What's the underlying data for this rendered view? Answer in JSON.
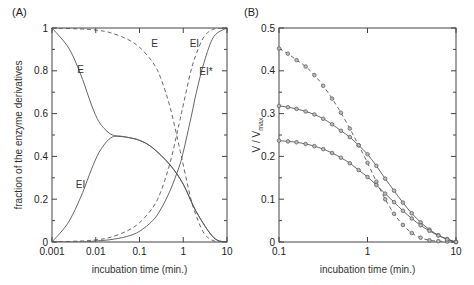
{
  "chart_data": [
    {
      "panel": "(A)",
      "type": "line",
      "xscale": "log",
      "xlabel": "incubation time (min.)",
      "ylabel": "fraction of the enzyme derivatives",
      "xlim": [
        0.001,
        10
      ],
      "ylim": [
        0,
        1
      ],
      "xticks": [
        "0.001",
        "0.01",
        "0.1",
        "1",
        "10"
      ],
      "yticks": [
        "0",
        "0.2",
        "0.4",
        "0.6",
        "0.8",
        "1"
      ],
      "grid": false,
      "series": [
        {
          "name": "E",
          "style": "solid",
          "x": [
            0.001,
            0.002,
            0.003,
            0.005,
            0.008,
            0.012,
            0.02,
            0.03,
            0.05,
            0.1,
            0.2,
            0.5,
            1,
            2,
            5,
            10
          ],
          "y": [
            1.0,
            0.93,
            0.87,
            0.76,
            0.64,
            0.56,
            0.51,
            0.495,
            0.49,
            0.475,
            0.44,
            0.36,
            0.27,
            0.14,
            0.02,
            0.0
          ]
        },
        {
          "name": "EI",
          "style": "solid",
          "x": [
            0.001,
            0.002,
            0.003,
            0.005,
            0.008,
            0.012,
            0.02,
            0.03,
            0.05,
            0.1,
            0.2,
            0.5,
            1,
            2,
            5,
            10
          ],
          "y": [
            0.0,
            0.07,
            0.13,
            0.23,
            0.34,
            0.42,
            0.48,
            0.495,
            0.49,
            0.475,
            0.44,
            0.36,
            0.27,
            0.14,
            0.02,
            0.0
          ]
        },
        {
          "name": "E",
          "style": "dashed",
          "x": [
            0.001,
            0.005,
            0.01,
            0.02,
            0.05,
            0.1,
            0.2,
            0.3,
            0.5,
            0.8,
            1,
            1.5,
            2,
            3,
            5,
            10
          ],
          "y": [
            1.0,
            0.995,
            0.99,
            0.98,
            0.95,
            0.91,
            0.84,
            0.77,
            0.63,
            0.45,
            0.36,
            0.2,
            0.12,
            0.04,
            0.005,
            0.0
          ]
        },
        {
          "name": "EI",
          "style": "dashed",
          "x": [
            0.001,
            0.005,
            0.01,
            0.02,
            0.05,
            0.1,
            0.2,
            0.3,
            0.5,
            0.8,
            1,
            1.5,
            2,
            3,
            5,
            10
          ],
          "y": [
            0.0,
            0.005,
            0.01,
            0.02,
            0.05,
            0.09,
            0.16,
            0.23,
            0.37,
            0.55,
            0.64,
            0.8,
            0.88,
            0.96,
            0.995,
            1.0
          ]
        },
        {
          "name": "EI*",
          "style": "solid",
          "x": [
            0.001,
            0.005,
            0.01,
            0.02,
            0.05,
            0.1,
            0.2,
            0.3,
            0.5,
            0.8,
            1,
            1.5,
            2,
            3,
            5,
            10
          ],
          "y": [
            0.0,
            0.0,
            0.005,
            0.01,
            0.025,
            0.05,
            0.1,
            0.15,
            0.24,
            0.35,
            0.42,
            0.58,
            0.7,
            0.84,
            0.96,
            1.0
          ]
        }
      ],
      "annotations": [
        {
          "text": "E",
          "x": 0.0045,
          "y": 0.81
        },
        {
          "text": "E",
          "x": 0.22,
          "y": 0.93
        },
        {
          "text": "EI",
          "x": 1.8,
          "y": 0.93
        },
        {
          "text": "EI*",
          "x": 3.3,
          "y": 0.8
        },
        {
          "text": "EI",
          "x": 0.0045,
          "y": 0.27
        }
      ]
    },
    {
      "panel": "(B)",
      "type": "line",
      "xscale": "log",
      "xlabel": "incubation time (min.)",
      "ylabel": "V / V",
      "ylabel_sub": "max",
      "xlim": [
        0.1,
        10
      ],
      "ylim": [
        0,
        0.5
      ],
      "xticks": [
        "0.1",
        "1",
        "10"
      ],
      "yticks": [
        "0",
        "0.1",
        "0.2",
        "0.3",
        "0.4",
        "0.5"
      ],
      "grid": false,
      "series": [
        {
          "name": "dashed (top start)",
          "style": "dashed",
          "markers": true,
          "x": [
            0.1,
            0.126,
            0.158,
            0.2,
            0.251,
            0.316,
            0.398,
            0.501,
            0.631,
            0.794,
            1.0,
            1.259,
            1.585,
            1.995,
            2.512,
            3.162,
            3.981,
            5.012,
            6.31,
            7.943,
            10.0
          ],
          "y": [
            0.452,
            0.44,
            0.425,
            0.41,
            0.39,
            0.365,
            0.335,
            0.302,
            0.265,
            0.226,
            0.185,
            0.141,
            0.1,
            0.066,
            0.04,
            0.021,
            0.01,
            0.004,
            0.002,
            0.001,
            0.0
          ]
        },
        {
          "name": "solid (middle start)",
          "style": "solid",
          "markers": true,
          "x": [
            0.1,
            0.126,
            0.158,
            0.2,
            0.251,
            0.316,
            0.398,
            0.501,
            0.631,
            0.794,
            1.0,
            1.259,
            1.585,
            1.995,
            2.512,
            3.162,
            3.981,
            5.012,
            6.31,
            7.943,
            10.0
          ],
          "y": [
            0.318,
            0.315,
            0.311,
            0.305,
            0.298,
            0.288,
            0.275,
            0.26,
            0.245,
            0.226,
            0.205,
            0.178,
            0.148,
            0.12,
            0.092,
            0.067,
            0.046,
            0.029,
            0.016,
            0.007,
            0.0
          ]
        },
        {
          "name": "solid (bottom start)",
          "style": "solid",
          "markers": true,
          "x": [
            0.1,
            0.126,
            0.158,
            0.2,
            0.251,
            0.316,
            0.398,
            0.501,
            0.631,
            0.794,
            1.0,
            1.259,
            1.585,
            1.995,
            2.512,
            3.162,
            3.981,
            5.012,
            6.31,
            7.943,
            10.0
          ],
          "y": [
            0.237,
            0.235,
            0.233,
            0.229,
            0.224,
            0.217,
            0.208,
            0.197,
            0.184,
            0.168,
            0.152,
            0.133,
            0.113,
            0.093,
            0.073,
            0.055,
            0.039,
            0.026,
            0.015,
            0.006,
            0.0
          ]
        }
      ]
    }
  ]
}
